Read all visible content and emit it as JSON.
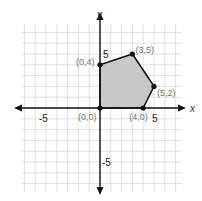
{
  "chart_data": {
    "type": "scatter",
    "title": "",
    "xlabel": "x",
    "ylabel": "y",
    "xlim": [
      -7,
      7
    ],
    "ylim": [
      -7,
      7
    ],
    "grid": true,
    "tick_labels": {
      "x": [
        "-5",
        "5"
      ],
      "y": [
        "5",
        "-5"
      ]
    },
    "polygon": {
      "shaded": true,
      "fill": "#c8c8c8",
      "vertices": [
        {
          "x": 0,
          "y": 0,
          "label": "(0,0)"
        },
        {
          "x": 0,
          "y": 4,
          "label": "(0,4)"
        },
        {
          "x": 3,
          "y": 5,
          "label": "(3,5)"
        },
        {
          "x": 5,
          "y": 2,
          "label": "(5,2)"
        },
        {
          "x": 4,
          "y": 0,
          "label": "(4,0)"
        }
      ]
    }
  }
}
